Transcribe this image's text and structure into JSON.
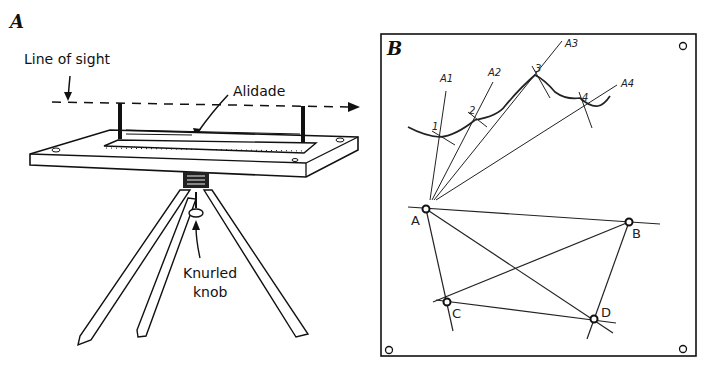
{
  "figure": {
    "panel_a": {
      "label": "A",
      "line_of_sight_label": "Line of sight",
      "alidade_label": "Alidade",
      "knob_label_line1": "Knurled",
      "knob_label_line2": "knob"
    },
    "panel_b": {
      "label": "B",
      "ray_labels": [
        "A1",
        "A2",
        "A3",
        "A4"
      ],
      "profile_point_labels": [
        "1",
        "2",
        "3",
        "4"
      ],
      "station_labels": [
        "A",
        "B",
        "C",
        "D"
      ]
    }
  },
  "colors": {
    "ink": "#1a1a1a",
    "background": "#ffffff"
  }
}
